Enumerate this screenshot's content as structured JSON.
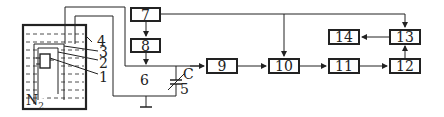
{
  "diagram": {
    "type": "block-diagram",
    "medium_label": "N",
    "medium_subscript": "2",
    "callouts": [
      "4",
      "3",
      "2",
      "1"
    ],
    "node_labels": {
      "n5": "5",
      "n6": "6",
      "capacitor": "C"
    },
    "blocks": [
      {
        "id": "b7",
        "label": "7"
      },
      {
        "id": "b8",
        "label": "8"
      },
      {
        "id": "b9",
        "label": "9"
      },
      {
        "id": "b10",
        "label": "10"
      },
      {
        "id": "b11",
        "label": "11"
      },
      {
        "id": "b12",
        "label": "12"
      },
      {
        "id": "b13",
        "label": "13"
      },
      {
        "id": "b14",
        "label": "14"
      }
    ],
    "edges": [
      [
        "7",
        "8"
      ],
      [
        "8",
        "6-line"
      ],
      [
        "6-line",
        "9"
      ],
      [
        "9",
        "10"
      ],
      [
        "7",
        "10"
      ],
      [
        "10",
        "11"
      ],
      [
        "11",
        "12"
      ],
      [
        "12",
        "13"
      ],
      [
        "7",
        "13"
      ],
      [
        "13",
        "14"
      ]
    ],
    "colors": {
      "line": "#222222",
      "background": "#ffffff"
    }
  }
}
